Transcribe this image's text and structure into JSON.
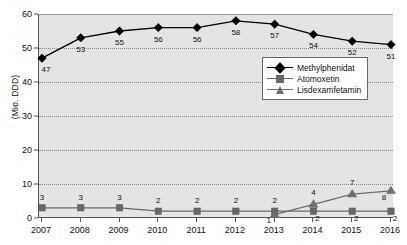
{
  "chart_data": {
    "type": "line",
    "title": "",
    "xlabel": "",
    "ylabel": "(Mio. DDD)",
    "categories": [
      "2007",
      "2008",
      "2009",
      "2010",
      "2011",
      "2012",
      "2013",
      "2014",
      "2015",
      "2016"
    ],
    "ylim": [
      0,
      60
    ],
    "yticks": [
      0,
      10,
      20,
      30,
      40,
      50,
      60
    ],
    "grid": true,
    "legend_position": "upper-right-inside",
    "series": [
      {
        "name": "Methylphenidat",
        "marker": "diamond",
        "color": "#000000",
        "values": [
          47,
          53,
          55,
          56,
          56,
          58,
          57,
          54,
          52,
          51
        ],
        "labels": [
          "47",
          "53",
          "55",
          "56",
          "56",
          "58",
          "57",
          "54",
          "52",
          "51"
        ]
      },
      {
        "name": "Atomoxetin",
        "marker": "square",
        "color": "#676767",
        "values": [
          3,
          3,
          3,
          2,
          2,
          2,
          2,
          2,
          2,
          2
        ],
        "labels": [
          "3",
          "3",
          "3",
          "2",
          "2",
          "2",
          "2",
          "2",
          "2",
          "2"
        ]
      },
      {
        "name": "Lisdexamfetamin",
        "marker": "triangle",
        "color": "#6f6f6f",
        "values": [
          null,
          null,
          null,
          null,
          null,
          null,
          1,
          4,
          7,
          8
        ],
        "labels": [
          "",
          "",
          "",
          "",
          "",
          "",
          "1",
          "4",
          "7",
          "8"
        ]
      }
    ]
  },
  "axis": {
    "y_title": "(Mio. DDD)",
    "y_tick_labels": [
      "0",
      "10",
      "20",
      "30",
      "40",
      "50",
      "60"
    ],
    "x_tick_labels": [
      "2007",
      "2008",
      "2009",
      "2010",
      "2011",
      "2012",
      "2013",
      "2014",
      "2015",
      "2016"
    ]
  },
  "legend": {
    "entries": [
      {
        "label": "Methylphenidat"
      },
      {
        "label": "Atomoxetin"
      },
      {
        "label": "Lisdexamfetamin"
      }
    ]
  },
  "colors": {
    "plot_background": "#e4e4e4",
    "page_background": "#ffffff",
    "axis": "#555555",
    "grid": "#8a8a8a",
    "series_1": "#000000",
    "series_2": "#676767",
    "series_3": "#6f6f6f"
  }
}
